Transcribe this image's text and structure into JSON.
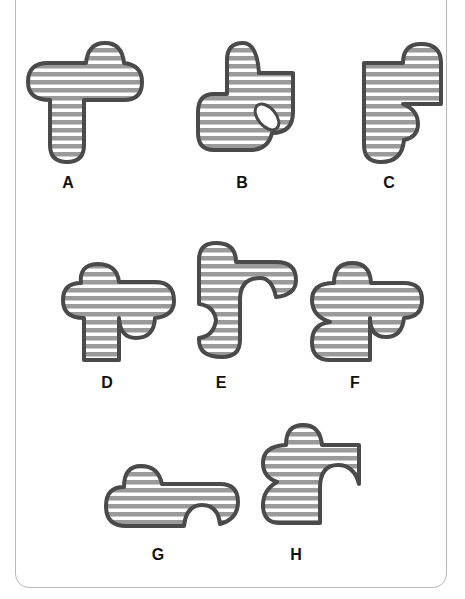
{
  "puzzle": {
    "type": "shape-matching",
    "options": [
      {
        "id": "A",
        "label": "A"
      },
      {
        "id": "B",
        "label": "B"
      },
      {
        "id": "C",
        "label": "C"
      },
      {
        "id": "D",
        "label": "D"
      },
      {
        "id": "E",
        "label": "E"
      },
      {
        "id": "F",
        "label": "F"
      },
      {
        "id": "G",
        "label": "G"
      },
      {
        "id": "H",
        "label": "H"
      }
    ],
    "colors": {
      "outline": "#4a4a4a",
      "stripe": "#9a9a9a",
      "background": "#ffffff",
      "frame": "#b8b8b8"
    }
  }
}
